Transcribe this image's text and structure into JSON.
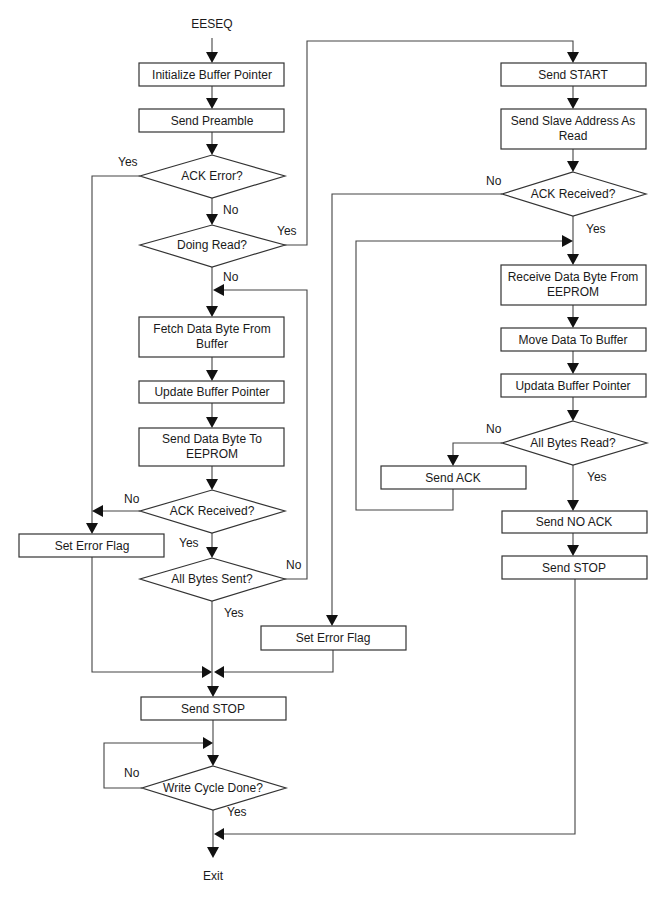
{
  "diagram": {
    "start_label": "EESEQ",
    "end_label": "Exit",
    "colors": {
      "line": "#444444",
      "box_border": "#333333",
      "text": "#1a1a1a",
      "background": "#ffffff"
    },
    "nodes": {
      "init_buffer": {
        "type": "process",
        "lines": [
          "Initialize Buffer Pointer"
        ]
      },
      "send_preamble": {
        "type": "process",
        "lines": [
          "Send Preamble"
        ]
      },
      "ack_error": {
        "type": "decision",
        "lines": [
          "ACK Error?"
        ]
      },
      "doing_read": {
        "type": "decision",
        "lines": [
          "Doing Read?"
        ]
      },
      "fetch_byte": {
        "type": "process",
        "lines": [
          "Fetch Data Byte From",
          "Buffer"
        ]
      },
      "update_pointer_w": {
        "type": "process",
        "lines": [
          "Update Buffer Pointer"
        ]
      },
      "send_byte": {
        "type": "process",
        "lines": [
          "Send Data Byte To",
          "EEPROM"
        ]
      },
      "ack_received_w": {
        "type": "decision",
        "lines": [
          "ACK Received?"
        ]
      },
      "set_error_left": {
        "type": "process",
        "lines": [
          "Set Error Flag"
        ]
      },
      "all_bytes_sent": {
        "type": "decision",
        "lines": [
          "All Bytes Sent?"
        ]
      },
      "send_start": {
        "type": "process",
        "lines": [
          "Send START"
        ]
      },
      "send_slave_addr": {
        "type": "process",
        "lines": [
          "Send Slave Address As",
          "Read"
        ]
      },
      "ack_received_r": {
        "type": "decision",
        "lines": [
          "ACK Received?"
        ]
      },
      "receive_byte": {
        "type": "process",
        "lines": [
          "Receive Data Byte From",
          "EEPROM"
        ]
      },
      "move_data": {
        "type": "process",
        "lines": [
          "Move Data To Buffer"
        ]
      },
      "update_pointer_r": {
        "type": "process",
        "lines": [
          "Updata Buffer Pointer"
        ]
      },
      "all_bytes_read": {
        "type": "decision",
        "lines": [
          "All Bytes Read?"
        ]
      },
      "send_ack": {
        "type": "process",
        "lines": [
          "Send ACK"
        ]
      },
      "send_no_ack": {
        "type": "process",
        "lines": [
          "Send NO ACK"
        ]
      },
      "send_stop_r": {
        "type": "process",
        "lines": [
          "Send STOP"
        ]
      },
      "set_error_mid": {
        "type": "process",
        "lines": [
          "Set Error Flag"
        ]
      },
      "send_stop_w": {
        "type": "process",
        "lines": [
          "Send STOP"
        ]
      },
      "write_cycle_done": {
        "type": "decision",
        "lines": [
          "Write Cycle Done?"
        ]
      }
    },
    "edge_labels": {
      "ack_error_yes": "Yes",
      "ack_error_no": "No",
      "doing_read_yes": "Yes",
      "doing_read_no": "No",
      "ack_received_w_no": "No",
      "ack_received_w_yes": "Yes",
      "all_bytes_sent_no": "No",
      "all_bytes_sent_yes": "Yes",
      "ack_received_r_no": "No",
      "ack_received_r_yes": "Yes",
      "all_bytes_read_no": "No",
      "all_bytes_read_yes": "Yes",
      "write_cycle_no": "No",
      "write_cycle_yes": "Yes"
    },
    "edges": [
      [
        "start",
        "init_buffer"
      ],
      [
        "init_buffer",
        "send_preamble"
      ],
      [
        "send_preamble",
        "ack_error"
      ],
      [
        "ack_error",
        "set_error_left",
        "Yes"
      ],
      [
        "ack_error",
        "doing_read",
        "No"
      ],
      [
        "doing_read",
        "send_start",
        "Yes"
      ],
      [
        "doing_read",
        "fetch_byte",
        "No"
      ],
      [
        "fetch_byte",
        "update_pointer_w"
      ],
      [
        "update_pointer_w",
        "send_byte"
      ],
      [
        "send_byte",
        "ack_received_w"
      ],
      [
        "ack_received_w",
        "set_error_left",
        "No"
      ],
      [
        "ack_received_w",
        "all_bytes_sent",
        "Yes"
      ],
      [
        "all_bytes_sent",
        "fetch_byte",
        "No"
      ],
      [
        "all_bytes_sent",
        "send_stop_w",
        "Yes"
      ],
      [
        "set_error_left",
        "send_stop_w"
      ],
      [
        "send_start",
        "send_slave_addr"
      ],
      [
        "send_slave_addr",
        "ack_received_r"
      ],
      [
        "ack_received_r",
        "set_error_mid",
        "No"
      ],
      [
        "ack_received_r",
        "receive_byte",
        "Yes"
      ],
      [
        "receive_byte",
        "move_data"
      ],
      [
        "move_data",
        "update_pointer_r"
      ],
      [
        "update_pointer_r",
        "all_bytes_read"
      ],
      [
        "all_bytes_read",
        "send_ack",
        "No"
      ],
      [
        "send_ack",
        "receive_byte"
      ],
      [
        "all_bytes_read",
        "send_no_ack",
        "Yes"
      ],
      [
        "send_no_ack",
        "send_stop_r"
      ],
      [
        "send_stop_r",
        "exit"
      ],
      [
        "set_error_mid",
        "send_stop_w"
      ],
      [
        "send_stop_w",
        "write_cycle_done"
      ],
      [
        "write_cycle_done",
        "write_cycle_done",
        "No"
      ],
      [
        "write_cycle_done",
        "exit",
        "Yes"
      ]
    ]
  }
}
